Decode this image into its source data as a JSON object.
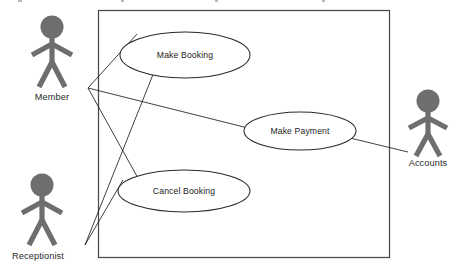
{
  "diagram": {
    "type": "uml-use-case-diagram",
    "title": "",
    "system_boundary": {
      "label": "",
      "x": 98,
      "y": 10,
      "width": 292,
      "height": 248,
      "stroke": "#4a4a4a"
    },
    "use_cases": [
      {
        "id": "make-booking",
        "label": "Make Booking",
        "cx": 185,
        "cy": 55,
        "rx": 65,
        "ry": 23
      },
      {
        "id": "make-payment",
        "label": "Make Payment",
        "cx": 300,
        "cy": 131,
        "rx": 56,
        "ry": 19
      },
      {
        "id": "cancel-booking",
        "label": "Cancel Booking",
        "cx": 184,
        "cy": 191,
        "rx": 66,
        "ry": 21
      }
    ],
    "actors": [
      {
        "id": "member",
        "label": "Member",
        "cx": 52,
        "top": 16,
        "label_x": 52,
        "label_y": 100,
        "fill": "#6e6e6e"
      },
      {
        "id": "receptionist",
        "label": "Receptionist",
        "cx": 42,
        "top": 174,
        "label_x": 38,
        "label_y": 259,
        "fill": "#6e6e6e"
      },
      {
        "id": "accounts",
        "label": "Accounts",
        "cx": 428,
        "top": 90,
        "label_x": 428,
        "label_y": 166,
        "fill": "#6e6e6e"
      }
    ],
    "associations": [
      {
        "id": "member-make-booking",
        "from": "member",
        "to": "make-booking",
        "points": "88,88 135,35"
      },
      {
        "id": "member-make-payment",
        "from": "member",
        "to": "make-payment",
        "points": "88,88 246,128"
      },
      {
        "id": "member-cancel-booking",
        "from": "member",
        "to": "cancel-booking",
        "points": "88,88 152,205"
      },
      {
        "id": "receptionist-make-booking",
        "from": "receptionist",
        "to": "make-booking",
        "points": "85,245 153,74"
      },
      {
        "id": "receptionist-cancel-booking",
        "from": "receptionist",
        "to": "cancel-booking",
        "points": "85,245 124,181"
      },
      {
        "id": "make-payment-accounts",
        "from": "make-payment",
        "to": "accounts",
        "points": "352,139 407,152"
      }
    ],
    "colors": {
      "actor_gray": "#6e6e6e",
      "line_dark": "#1f1f1f",
      "boundary_gray": "#4a4a4a",
      "ellipse_stroke": "#2a2a2a",
      "background": "#ffffff",
      "text": "#1a1a1a"
    }
  }
}
